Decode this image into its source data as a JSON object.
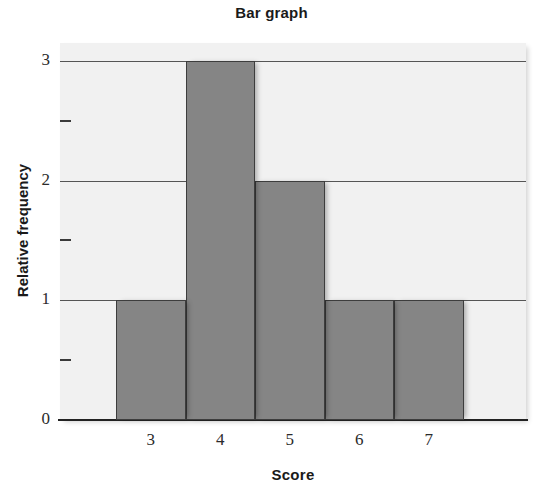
{
  "chart_data": {
    "type": "bar",
    "title": "Bar graph",
    "xlabel": "Score",
    "ylabel": "Relative frequency",
    "categories": [
      "3",
      "4",
      "5",
      "6",
      "7"
    ],
    "values": [
      1,
      3,
      2,
      1,
      1
    ],
    "ylim": [
      0,
      3.15
    ],
    "y_major_ticks": [
      "0",
      "1",
      "2",
      "3"
    ],
    "y_minor_ticks": [
      0.5,
      1.5,
      2.5
    ],
    "x_tick_labels": [
      "3",
      "4",
      "5",
      "6",
      "7"
    ],
    "grid": true,
    "legend": "none",
    "bars_adjacent": true,
    "colors": {
      "bar_fill": "#858585",
      "bar_edge": "#3d3d3d",
      "plot_background": "#f1f1f1",
      "gridline": "#555555",
      "axis": "#222222",
      "text": "#1a1a1a"
    }
  }
}
